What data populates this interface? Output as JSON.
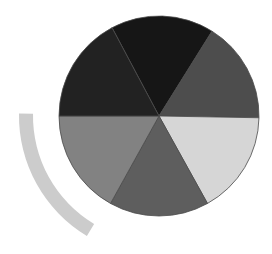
{
  "figure": {
    "width": 272,
    "height": 254,
    "background": "#ffffff",
    "pie": {
      "cx": 159,
      "cy": 116,
      "r": 100,
      "divider_color": "#4a4a4a",
      "segments": [
        {
          "name": "segment-top",
          "start": -118,
          "end": -58,
          "color": "#161616"
        },
        {
          "name": "segment-upper-right",
          "start": -58,
          "end": 1,
          "color": "#4d4d4d"
        },
        {
          "name": "segment-lower-right",
          "start": 1,
          "end": 61,
          "color": "#d6d6d6"
        },
        {
          "name": "segment-bottom",
          "start": 61,
          "end": 119,
          "color": "#5e5e5e"
        },
        {
          "name": "segment-lower-left",
          "start": 119,
          "end": 180,
          "color": "#828282"
        },
        {
          "name": "segment-upper-left",
          "start": 180,
          "end": 242,
          "color": "#222222"
        }
      ]
    },
    "arc": {
      "cx": 159,
      "cy": 116,
      "r_inner": 126,
      "r_outer": 140,
      "start": 121,
      "end": 181,
      "color": "#cccccc"
    }
  }
}
